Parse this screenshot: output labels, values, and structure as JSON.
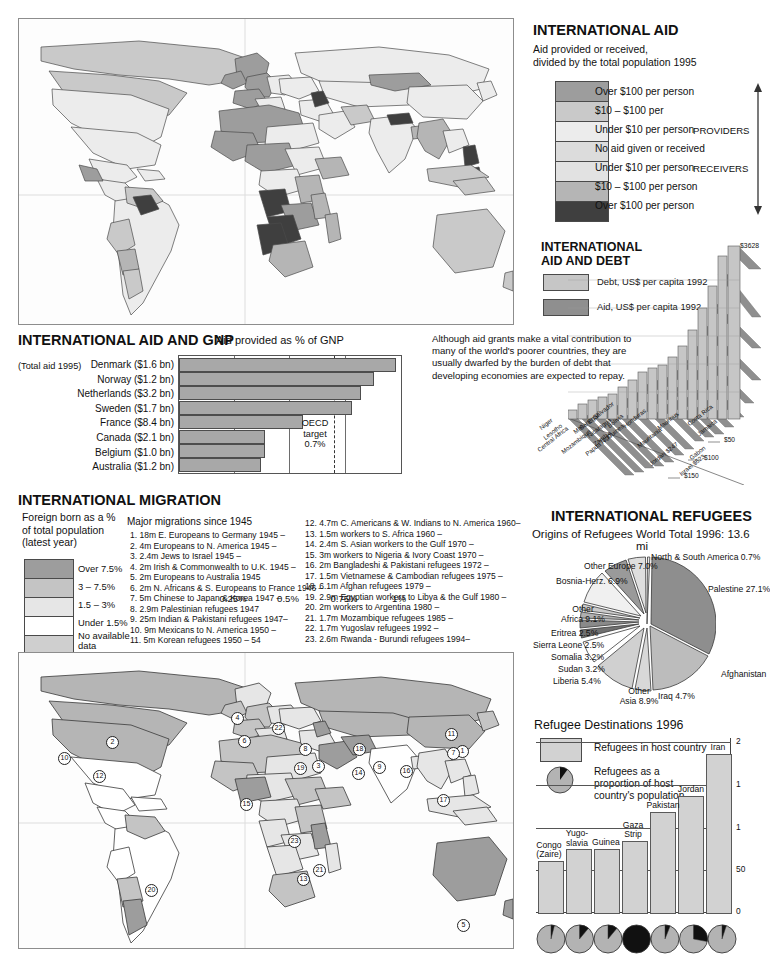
{
  "colors": {
    "provider_over100": "#9d9d9d",
    "provider_10_100": "#c9c9c9",
    "provider_under10": "#ececec",
    "no_aid": "#dcdcdc",
    "receiver_under10": "#e2e2e2",
    "receiver_10_100": "#b5b5b5",
    "receiver_over100": "#3f3f3f",
    "bar_fill": "#a8a8a8",
    "debt_fill": "#c6c6c6",
    "aid_fill": "#8f8f8f",
    "land_default": "#f2f2f2",
    "ocean": "#fdfdfd"
  },
  "aid_map": {
    "title": "INTERNATIONAL AID",
    "subtitle_line1": "Aid provided or received,",
    "subtitle_line2": "divided by the total population 1995",
    "providers_label": "PROVIDERS",
    "receivers_label": "RECEIVERS",
    "legend": [
      {
        "label": "Over $100 per person",
        "color": "#9d9d9d"
      },
      {
        "label": "$10 – $100 per",
        "color": "#c9c9c9"
      },
      {
        "label": "Under $10 per person",
        "color": "#ececec"
      },
      {
        "label": "No aid given or received",
        "color": "#dcdcdc"
      },
      {
        "label": "Under $10 per person",
        "color": "#e2e2e2"
      },
      {
        "label": "$10 – $100 per person",
        "color": "#b5b5b5"
      },
      {
        "label": "Over $100 per person",
        "color": "#3f3f3f"
      }
    ]
  },
  "aid_gnp": {
    "title": "INTERNATIONAL AID AND GNP",
    "subtitle": "Aid provided as % of GNP",
    "total_note": "(Total aid 1995)",
    "target_line1": "OECD",
    "target_line2": "target",
    "target_line3": "0.7%",
    "chart_data": {
      "type": "bar",
      "title": "Aid provided as % of GNP",
      "xlabel": "",
      "ylabel": "",
      "xlim": [
        0,
        1.0
      ],
      "orientation": "horizontal",
      "grid": true,
      "tick_labels": [
        "0.25%",
        "0.5%",
        "0.75%",
        "1%"
      ],
      "tick_values": [
        0.25,
        0.5,
        0.75,
        1.0
      ],
      "target_value": 0.7,
      "categories": [
        "Denmark ($1.6 bn)",
        "Norway ($1.2 bn)",
        "Netherlands ($3.2 bn)",
        "Sweden ($1.7 bn)",
        "France ($8.4 bn)",
        "Canada ($2.1 bn)",
        "Belgium ($1.0 bn)",
        "Australia ($1.2 bn)"
      ],
      "values": [
        0.97,
        0.87,
        0.81,
        0.77,
        0.55,
        0.38,
        0.38,
        0.36
      ]
    }
  },
  "aid_debt": {
    "title_line1": "INTERNATIONAL",
    "title_line2": "AID AND DEBT",
    "legend": [
      {
        "label": "Debt, US$ per capita 1992",
        "color": "#c6c6c6"
      },
      {
        "label": "Aid, US$ per capita 1992",
        "color": "#8f8f8f"
      }
    ],
    "note": "Although aid grants make a vital contribution to many of the world's poorer countries, they are usually dwarfed by the burden of debt that developing economies are expected to repay.",
    "peak_label": "$3628",
    "axis_labels": [
      "$50",
      "$100",
      "$150"
    ],
    "chart_data": {
      "type": "bar",
      "title": "International Aid and Debt",
      "ylabel": "US$ per capita 1992",
      "series": [
        {
          "name": "Debt, US$ per capita 1992",
          "values": [
            60,
            95,
            120,
            135,
            160,
            230,
            300,
            420,
            500,
            545,
            630,
            760,
            1000,
            1330,
            1880,
            2660,
            3628
          ]
        },
        {
          "name": "Aid, US$ per capita 1992",
          "values": [
            48,
            50,
            60,
            55,
            62,
            45,
            40,
            52,
            30,
            25,
            35,
            20,
            16,
            247,
            14,
            523,
            12
          ]
        }
      ],
      "categories": [
        "Niger",
        "Lesotho",
        "Central Africa",
        "Mali",
        "Mozambique",
        "Nicaragua",
        "Togo",
        "El Salvador",
        "Senegal",
        "Bolivia",
        "Honduras",
        "Zambia",
        "Papua N. Guinea",
        "Mauritania",
        "Mauritius",
        "Costa Rica",
        "Jamaica"
      ],
      "extra_labels": [
        "Jordan $247",
        "Gabon",
        "Israel $523"
      ]
    }
  },
  "migration": {
    "title": "INTERNATIONAL MIGRATION",
    "legend_title_line1": "Foreign born as a %",
    "legend_title_line2": "of total population",
    "legend_title_line3": "(latest year)",
    "legend": [
      {
        "label": "Over 7.5%",
        "color": "#9d9d9d"
      },
      {
        "label": "3 – 7.5%",
        "color": "#c4c4c4"
      },
      {
        "label": "1.5 – 3%",
        "color": "#e6e6e6"
      },
      {
        "label": "Under 1.5%",
        "color": "#ffffff"
      },
      {
        "label": "No available\ndata",
        "color": "#cfcfcf"
      }
    ],
    "list_title": "Major migrations since 1945",
    "list_left": [
      " 1.  18m E. Europeans to Germany 1945 –",
      " 2.  4m Europeans to N. America 1945 –",
      " 3.  2.4m Jews to Israel 1945 –",
      " 4.  2m Irish & Commonwealth to U.K. 1945 –",
      " 5.  2m Europeans to Australia 1945",
      " 6.  2m N. Africans & S. Europeans to France 1946 –",
      " 7.  5m Chinese to Japan & Korea 1947 –",
      " 8.  2.9m Palestinian refugees 1947",
      " 9.  25m Indian & Pakistani refugees 1947–",
      "10.  9m Mexicans to N. America 1950 –",
      "11.  5m Korean refugees 1950 – 54"
    ],
    "list_right": [
      "12.  4.7m C. Americans & W. Indians to N. America 1960–",
      "13.  1.5m workers to S. Africa 1960 –",
      "14.  2.4m S. Asian workers to the Gulf 1970 –",
      "15.  3m workers to Nigeria & Ivory Coast 1970 –",
      "16.  2m Bangladeshi & Pakistani refugees 1972 –",
      "17.  1.5m Vietnamese & Cambodian refugees 1975 –",
      "18.  6.1m Afghan refugees 1979 –",
      "19.  2.9m Egyptian workers to Libya & the Gulf 1980 –",
      "20.  2m workers to Argentina 1980 –",
      "21.  1.7m Mozambique refugees 1985 –",
      "22.  1.7m Yugoslav refugees 1992 –",
      "23.  2.6m Rwanda - Burundi refugees 1994–"
    ],
    "map_pins": [
      {
        "n": "1",
        "x": 456,
        "y": 745
      },
      {
        "n": "2",
        "x": 106,
        "y": 736
      },
      {
        "n": "3",
        "x": 312,
        "y": 760
      },
      {
        "n": "4",
        "x": 231,
        "y": 712
      },
      {
        "n": "5",
        "x": 457,
        "y": 919
      },
      {
        "n": "6",
        "x": 238,
        "y": 735
      },
      {
        "n": "7",
        "x": 447,
        "y": 747
      },
      {
        "n": "8",
        "x": 299,
        "y": 743
      },
      {
        "n": "9",
        "x": 373,
        "y": 761
      },
      {
        "n": "10",
        "x": 58,
        "y": 752
      },
      {
        "n": "11",
        "x": 445,
        "y": 728
      },
      {
        "n": "12",
        "x": 93,
        "y": 770
      },
      {
        "n": "13",
        "x": 297,
        "y": 873
      },
      {
        "n": "14",
        "x": 352,
        "y": 767
      },
      {
        "n": "15",
        "x": 240,
        "y": 798
      },
      {
        "n": "16",
        "x": 400,
        "y": 765
      },
      {
        "n": "17",
        "x": 437,
        "y": 794
      },
      {
        "n": "18",
        "x": 353,
        "y": 743
      },
      {
        "n": "19",
        "x": 294,
        "y": 762
      },
      {
        "n": "20",
        "x": 145,
        "y": 884
      },
      {
        "n": "21",
        "x": 313,
        "y": 864
      },
      {
        "n": "22",
        "x": 272,
        "y": 722
      },
      {
        "n": "23",
        "x": 288,
        "y": 835
      }
    ]
  },
  "refugees": {
    "title": "INTERNATIONAL REFUGEES",
    "subtitle_left": "Origins of Refugees",
    "subtitle_right": "World Total 1996: 13.6 mi",
    "chart_data": {
      "type": "pie",
      "title": "Origins of Refugees",
      "subtitle": "World Total 1996: 13.6 million",
      "legend_position": "callout-labels",
      "slices": [
        {
          "label": "North & South America 0.7%",
          "value": 0.7,
          "color": "#e8e8e8"
        },
        {
          "label": "Palestine 27.1%",
          "value": 27.1,
          "color": "#8e8e8e"
        },
        {
          "label": "Afghanistan",
          "value": 20.6,
          "color": "#bcbcbc"
        },
        {
          "label": "Iraq 4.7%",
          "value": 4.7,
          "color": "#d8d8d8"
        },
        {
          "label": "Other Asia 8.9%",
          "value": 8.9,
          "color": "#d0d0d0"
        },
        {
          "label": "Liberia 5.4%",
          "value": 5.4,
          "color": "#ffffff"
        },
        {
          "label": "Sudan 3.2%",
          "value": 3.2,
          "color": "#707070"
        },
        {
          "label": "Somalia 3.2%",
          "value": 3.2,
          "color": "#8a8a8a"
        },
        {
          "label": "Sierra Leone 2.5%",
          "value": 2.5,
          "color": "#b0b0b0"
        },
        {
          "label": "Eritrea 2.5%",
          "value": 2.5,
          "color": "#cacaca"
        },
        {
          "label": "Other Africa 9.1%",
          "value": 9.1,
          "color": "#f0f0f0"
        },
        {
          "label": "Bosnia-Herz. 6.9%",
          "value": 6.9,
          "color": "#9a9a9a"
        },
        {
          "label": "Other Europe 7.0%",
          "value": 7.0,
          "color": "#dedede"
        }
      ]
    }
  },
  "destinations": {
    "title": "Refugee Destinations 1996",
    "legend_bar_label": "Refugees in host country",
    "legend_pie_line1": "Refugees as a",
    "legend_pie_line2": "proportion of host",
    "legend_pie_line3": "country's population",
    "chart_data": {
      "type": "bar",
      "title": "Refugee Destinations 1996",
      "ylabel": "Refugees in host country",
      "ylim": [
        0,
        2200000
      ],
      "tick_labels": [
        "2",
        "1",
        "1",
        "50",
        "0"
      ],
      "categories": [
        "Congo\n(Zaire)",
        "Yugo-\nslavia",
        "Guinea",
        "Gaza\nStrip",
        "Pakistan",
        "Jordan",
        "Iran"
      ],
      "values": [
        660000,
        810000,
        810000,
        920000,
        1300000,
        1500000,
        2050000
      ],
      "proportion_of_population": [
        4,
        11,
        11,
        100,
        6,
        28,
        5
      ]
    }
  }
}
